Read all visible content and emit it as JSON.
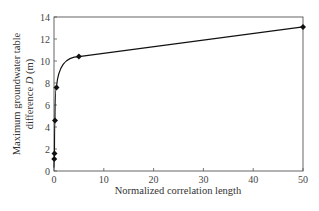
{
  "chart_data": {
    "type": "line",
    "title": "",
    "xlabel": "Normalized correlation length",
    "ylabel_line1": "Maximum groundwater table",
    "ylabel_line2_prefix": "difference ",
    "ylabel_symbol": "D",
    "ylabel_unit": " (m)",
    "xlim": [
      0,
      50
    ],
    "ylim": [
      0,
      14
    ],
    "xticks": [
      0,
      10,
      20,
      30,
      40,
      50
    ],
    "yticks": [
      0,
      2,
      4,
      6,
      8,
      10,
      12,
      14
    ],
    "grid": false,
    "legend": null,
    "marker": "diamond",
    "series": [
      {
        "name": "Maximum groundwater table difference D",
        "x": [
          0.05,
          0.1,
          0.2,
          0.5,
          5,
          50
        ],
        "y": [
          1.1,
          1.6,
          4.6,
          7.6,
          10.4,
          13.1
        ]
      }
    ],
    "colors": {
      "line": "#111111",
      "axis": "#555555",
      "marker": "#111111"
    }
  }
}
